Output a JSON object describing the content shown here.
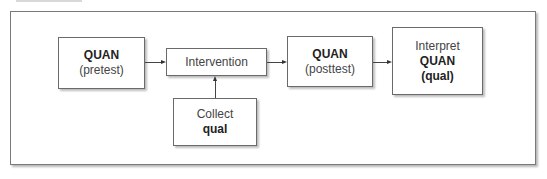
{
  "diagram": {
    "nodes": [
      {
        "id": "pretest",
        "line1": "QUAN",
        "line2": "(pretest)"
      },
      {
        "id": "intervention",
        "line1": "Intervention"
      },
      {
        "id": "collect",
        "line1": "Collect",
        "line2": "qual"
      },
      {
        "id": "posttest",
        "line1": "QUAN",
        "line2": "(posttest)"
      },
      {
        "id": "interpret",
        "line1": "Interpret",
        "line2": "QUAN",
        "line3": "(qual)"
      }
    ],
    "edges": [
      {
        "from": "pretest",
        "to": "intervention"
      },
      {
        "from": "collect",
        "to": "intervention"
      },
      {
        "from": "intervention",
        "to": "posttest"
      },
      {
        "from": "posttest",
        "to": "interpret"
      }
    ]
  }
}
